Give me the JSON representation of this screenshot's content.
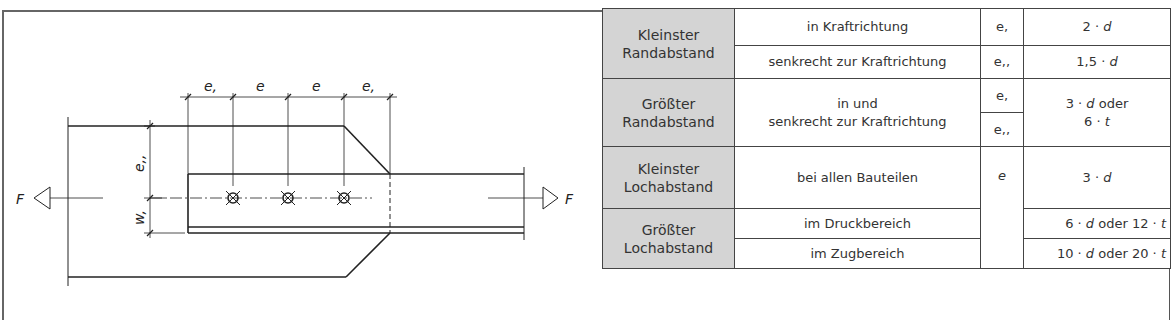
{
  "diagram": {
    "force_label_left": "F",
    "force_label_right": "F",
    "dimension_labels_top": [
      "e,",
      "e",
      "e",
      "e,"
    ],
    "dimension_label_vertical_upper": "e,,",
    "dimension_label_vertical_lower": "w,",
    "hole_count": 3
  },
  "table": {
    "rows": [
      {
        "category": "Kleinster Randabstand",
        "condition": "in Kraftrichtung",
        "symbol": "e,",
        "value_num": "2 · ",
        "value_var": "d",
        "value_rest": ""
      },
      {
        "condition": "senkrecht zur Kraftrichtung",
        "symbol": "e,,",
        "value_num": "1,5 · ",
        "value_var": "d",
        "value_rest": ""
      },
      {
        "category": "Größter Randabstand",
        "condition_line1": "in und",
        "condition_line2": "senkrecht zur Kraftrichtung",
        "symbol_a": "e,",
        "symbol_b": "e,,",
        "value_line1_num": "3 · ",
        "value_line1_var": "d",
        "value_line1_rest": " oder",
        "value_line2_num": "6 · ",
        "value_line2_var": "t"
      },
      {
        "category": "Kleinster Lochabstand",
        "condition": "bei allen Bauteilen",
        "symbol": "e",
        "value_num": "3 · ",
        "value_var": "d"
      },
      {
        "category": "Größter Lochabstand",
        "condition": "im Druckbereich",
        "value_a": "6 · ",
        "value_var_a": "d",
        "value_mid": " oder 12 · ",
        "value_var_b": "t"
      },
      {
        "condition": "im Zugbereich",
        "value_a": "10 · ",
        "value_var_a": "d",
        "value_mid": " oder 20 · ",
        "value_var_b": "t"
      }
    ],
    "categories": {
      "r1_line1": "Kleinster",
      "r1_line2": "Randabstand",
      "r2_line1": "Größter",
      "r2_line2": "Randabstand",
      "r3_line1": "Kleinster",
      "r3_line2": "Lochabstand",
      "r4_line1": "Größter",
      "r4_line2": "Lochabstand"
    }
  }
}
